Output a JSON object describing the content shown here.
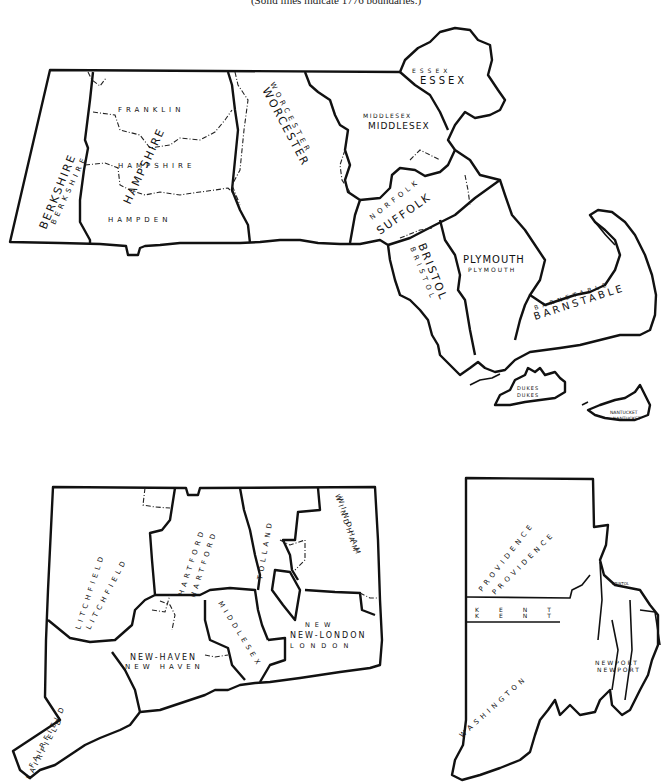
{
  "caption": "(Solid lines indicate 1776 boundaries.)",
  "maps": {
    "massachusetts": {
      "counties": {
        "berkshire": {
          "label_1776": "BERKSHIRE",
          "label_modern": "BERKSHIRE"
        },
        "franklin": {
          "label_modern": "FRANKLIN"
        },
        "hampshire": {
          "label_1776": "HAMPSHIRE",
          "label_modern": "HAMPSHIRE"
        },
        "hampden": {
          "label_modern": "HAMPDEN"
        },
        "worcester": {
          "label_1776": "WORCESTER",
          "label_modern": "WORCESTER"
        },
        "middlesex": {
          "label_1776": "MIDDLESEX",
          "label_modern": "MIDDLESEX"
        },
        "essex": {
          "label_1776": "ESSEX",
          "label_modern": "ESSEX"
        },
        "suffolk": {
          "label_1776": "SUFFOLK",
          "label_modern": "SUFFOLK"
        },
        "norfolk": {
          "label_modern": "NORFOLK"
        },
        "bristol": {
          "label_1776": "BRISTOL",
          "label_modern": "BRISTOL"
        },
        "plymouth": {
          "label_1776": "PLYMOUTH",
          "label_modern": "PLYMOUTH"
        },
        "barnstable": {
          "label_1776": "BARNSTABLE",
          "label_modern": "BARNSTABLE"
        },
        "dukes": {
          "label_1776": "DUKES",
          "label_modern": "DUKES"
        },
        "nantucket": {
          "label_1776": "NANTUCKET",
          "label_modern": "NANTUCKET"
        }
      }
    },
    "connecticut": {
      "counties": {
        "litchfield": {
          "label_1776": "LITCHFIELD",
          "label_modern": "LITCHFIELD"
        },
        "hartford": {
          "label_1776": "HARTFORD",
          "label_modern": "HARTFORD"
        },
        "tolland": {
          "label_modern": "TOLLAND"
        },
        "windham": {
          "label_1776": "WINDHAM",
          "label_modern": "WINDHAM"
        },
        "fairfield": {
          "label_1776": "FAIRFIELD",
          "label_modern": "FAIRFIELD"
        },
        "new_haven": {
          "label_1776": "NEW-HAVEN",
          "label_modern": "NEW HAVEN"
        },
        "middlesex": {
          "label_modern": "MIDDLESEX"
        },
        "new_london": {
          "label_1776": "NEW-LONDON",
          "label_modern": "NEW LONDON"
        }
      }
    },
    "rhode_island": {
      "counties": {
        "providence": {
          "label_1776": "PROVIDENCE",
          "label_modern": "PROVIDENCE"
        },
        "kent": {
          "label_1776": "KENT",
          "label_modern": "KENT"
        },
        "washington": {
          "label_1776": "WASHINGTON",
          "label_modern": "WASHINGTON"
        },
        "bristol": {
          "label_1776": "BRISTOL",
          "label_modern": "BRISTOL"
        },
        "newport": {
          "label_1776": "NEWPORT",
          "label_modern": "NEWPORT"
        }
      }
    }
  }
}
